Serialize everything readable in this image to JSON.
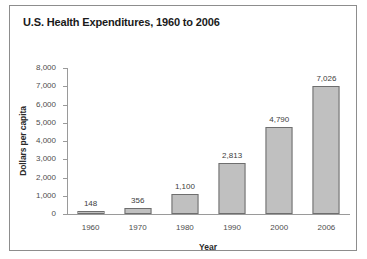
{
  "figure": {
    "title": "U.S. Health Expenditures, 1960 to 2006",
    "border_color": "#8d8d8d",
    "background": "#ffffff"
  },
  "chart_data": {
    "type": "bar",
    "title": "U.S. Health Expenditures, 1960 to 2006",
    "xlabel": "Year",
    "ylabel": "Dollars per capita",
    "categories": [
      "1960",
      "1970",
      "1980",
      "1990",
      "2000",
      "2006"
    ],
    "values": [
      148,
      356,
      1100,
      2813,
      4790,
      7026
    ],
    "value_labels": [
      "148",
      "356",
      "1,100",
      "2,813",
      "4,790",
      "7,026"
    ],
    "ylim": [
      0,
      8000
    ],
    "ytick_values": [
      0,
      1000,
      2000,
      3000,
      4000,
      5000,
      6000,
      7000,
      8000
    ],
    "ytick_labels": [
      "0",
      "1,000",
      "2,000",
      "3,000",
      "4,000",
      "5,000",
      "6,000",
      "7,000",
      "8,000"
    ],
    "grid": false,
    "legend": null,
    "bar_color": "#c0c0c0",
    "bar_border_color": "#6e6e6e",
    "axis_color": "#9a9a9a"
  }
}
